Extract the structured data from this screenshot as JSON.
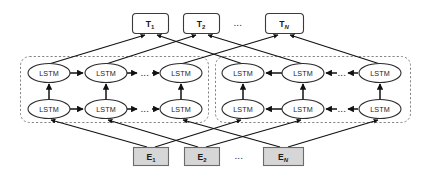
{
  "figure": {
    "kind": "bilstm-architecture-diagram",
    "background_color": "#ffffff",
    "line_color": "#111111",
    "ellipse_fill": "#ffffff",
    "ellipse_stroke": "#2b2b2b",
    "output_box_fill": "#ffffff",
    "output_box_stroke": "#3a3a3a",
    "input_box_fill": "#d6d6d6",
    "input_box_stroke": "#6b6b6b",
    "dashed_group_stroke": "#808080"
  },
  "outputs": {
    "name": "output-tag-row",
    "items": [
      {
        "base": "T",
        "sub": "1",
        "sub_italic": false
      },
      {
        "base": "T",
        "sub": "2",
        "sub_italic": false
      },
      {
        "base": "T",
        "sub": "N",
        "sub_italic": true
      }
    ],
    "ellipsis": "..."
  },
  "inputs": {
    "name": "input-embedding-row",
    "items": [
      {
        "base": "E",
        "sub": "1",
        "sub_italic": false
      },
      {
        "base": "E",
        "sub": "2",
        "sub_italic": false
      },
      {
        "base": "E",
        "sub": "N",
        "sub_italic": true
      }
    ],
    "ellipsis": "..."
  },
  "groups": [
    {
      "name": "forward-lstm-group",
      "direction": "forward",
      "cells": [
        "LSTM",
        "LSTM",
        "LSTM",
        "LSTM",
        "LSTM",
        "LSTM"
      ],
      "ellipsis": "..."
    },
    {
      "name": "backward-lstm-group",
      "direction": "backward",
      "cells": [
        "LSTM",
        "LSTM",
        "LSTM",
        "LSTM",
        "LSTM",
        "LSTM"
      ],
      "ellipsis": "..."
    }
  ],
  "cell_label": "LSTM"
}
